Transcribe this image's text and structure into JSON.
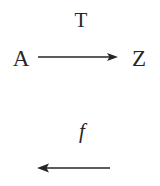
{
  "diagram": {
    "background_color": "#ffffff",
    "ink_color": "#262626",
    "nodes": [
      {
        "id": "A",
        "label": "A",
        "x": 21,
        "y": 58
      },
      {
        "id": "Z",
        "label": "Z",
        "x": 139,
        "y": 58
      }
    ],
    "edges": [
      {
        "id": "edge-T",
        "label": "T",
        "direction": "right",
        "from": "A",
        "to": "Z",
        "x_start": 38,
        "x_end": 118,
        "y": 57,
        "label_x": 81,
        "label_y": 20
      },
      {
        "id": "edge-f",
        "label": "f",
        "direction": "left",
        "from": "",
        "to": "",
        "x_start": 110,
        "x_end": 37,
        "y": 168,
        "label_x": 82,
        "label_y": 131
      }
    ]
  }
}
